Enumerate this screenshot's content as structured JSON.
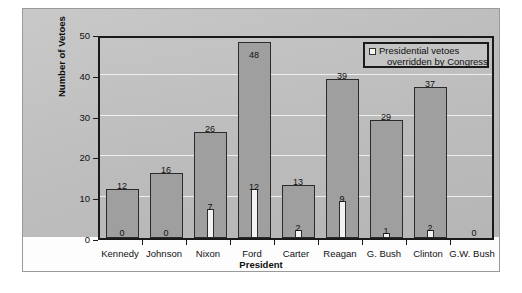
{
  "chart_data": {
    "type": "bar",
    "title": "",
    "xlabel": "President",
    "ylabel": "Number of Vetoes",
    "ylim": [
      0,
      50
    ],
    "yticks": [
      "0",
      "10",
      "20",
      "30",
      "40",
      "50"
    ],
    "grid": true,
    "legend_position": "top-right",
    "categories": [
      "Kennedy",
      "Johnson",
      "Nixon",
      "Ford",
      "Carter",
      "Reagan",
      "G. Bush",
      "Clinton",
      "G.W. Bush"
    ],
    "series": [
      {
        "name": "Presidential vetoes",
        "values": [
          12,
          16,
          26,
          48,
          13,
          39,
          29,
          37,
          0
        ],
        "color": "#9f9f9f"
      },
      {
        "name": "Presidential vetoes overridden by Congress",
        "values": [
          0,
          0,
          7,
          12,
          2,
          9,
          1,
          2,
          0
        ],
        "color": "#f2f2f2"
      }
    ]
  },
  "legend": {
    "line1": "Presidential vetoes",
    "line2": "overridden by Congress",
    "swatch_color": "#f5f5f5"
  },
  "axis": {
    "y_title": "Number of Vetoes",
    "x_title": "President"
  }
}
